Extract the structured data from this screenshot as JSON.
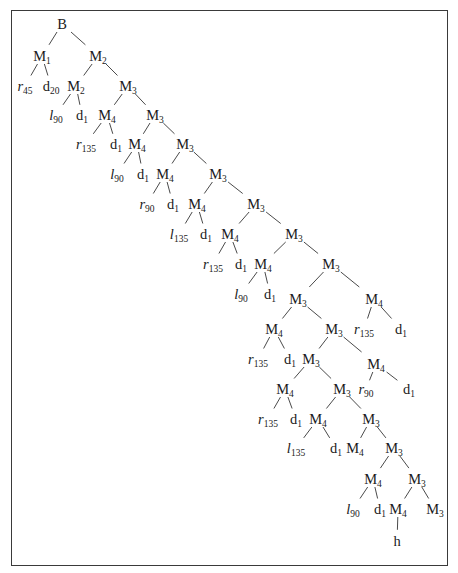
{
  "diagram": {
    "type": "derivation-tree",
    "frame": {
      "stroke": "#3a3a3a"
    },
    "colors": {
      "text": "#1a1a1a",
      "edge": "#4a4a4a",
      "background": "#ffffff"
    },
    "nodes": [
      {
        "id": "n0",
        "base": "B",
        "sub": "",
        "italic": false,
        "x": 62,
        "y": 28
      },
      {
        "id": "n1",
        "base": "M",
        "sub": "1",
        "italic": false,
        "x": 42,
        "y": 60
      },
      {
        "id": "n2",
        "base": "M",
        "sub": "2",
        "italic": false,
        "x": 98,
        "y": 60
      },
      {
        "id": "n3",
        "base": "r",
        "sub": "45",
        "italic": true,
        "x": 25,
        "y": 90
      },
      {
        "id": "n4",
        "base": "d",
        "sub": "20",
        "italic": false,
        "x": 51,
        "y": 90
      },
      {
        "id": "n5",
        "base": "M",
        "sub": "2",
        "italic": false,
        "x": 76,
        "y": 90
      },
      {
        "id": "n6",
        "base": "M",
        "sub": "3",
        "italic": false,
        "x": 128,
        "y": 90
      },
      {
        "id": "n7",
        "base": "l",
        "sub": "90",
        "italic": true,
        "x": 56,
        "y": 119
      },
      {
        "id": "n8",
        "base": "d",
        "sub": "1",
        "italic": false,
        "x": 82,
        "y": 119
      },
      {
        "id": "n9",
        "base": "M",
        "sub": "4",
        "italic": false,
        "x": 107,
        "y": 119
      },
      {
        "id": "n10",
        "base": "M",
        "sub": "3",
        "italic": false,
        "x": 155,
        "y": 119
      },
      {
        "id": "n11",
        "base": "r",
        "sub": "135",
        "italic": true,
        "x": 86,
        "y": 148
      },
      {
        "id": "n12",
        "base": "d",
        "sub": "1",
        "italic": false,
        "x": 116,
        "y": 148
      },
      {
        "id": "n13",
        "base": "M",
        "sub": "4",
        "italic": false,
        "x": 137,
        "y": 148
      },
      {
        "id": "n14",
        "base": "M",
        "sub": "3",
        "italic": false,
        "x": 185,
        "y": 148
      },
      {
        "id": "n15",
        "base": "l",
        "sub": "90",
        "italic": true,
        "x": 117,
        "y": 178
      },
      {
        "id": "n16",
        "base": "d",
        "sub": "1",
        "italic": false,
        "x": 143,
        "y": 178
      },
      {
        "id": "n17",
        "base": "M",
        "sub": "4",
        "italic": false,
        "x": 165,
        "y": 178
      },
      {
        "id": "n18",
        "base": "M",
        "sub": "3",
        "italic": false,
        "x": 218,
        "y": 178
      },
      {
        "id": "n19",
        "base": "r",
        "sub": "90",
        "italic": true,
        "x": 147,
        "y": 208
      },
      {
        "id": "n20",
        "base": "d",
        "sub": "1",
        "italic": false,
        "x": 173,
        "y": 208
      },
      {
        "id": "n21",
        "base": "M",
        "sub": "4",
        "italic": false,
        "x": 197,
        "y": 208
      },
      {
        "id": "n22",
        "base": "M",
        "sub": "3",
        "italic": false,
        "x": 256,
        "y": 208
      },
      {
        "id": "n23",
        "base": "l",
        "sub": "135",
        "italic": true,
        "x": 179,
        "y": 238
      },
      {
        "id": "n24",
        "base": "d",
        "sub": "1",
        "italic": false,
        "x": 206,
        "y": 238
      },
      {
        "id": "n25",
        "base": "M",
        "sub": "4",
        "italic": false,
        "x": 230,
        "y": 238
      },
      {
        "id": "n26",
        "base": "M",
        "sub": "3",
        "italic": false,
        "x": 294,
        "y": 238
      },
      {
        "id": "n27",
        "base": "r",
        "sub": "135",
        "italic": true,
        "x": 213,
        "y": 268
      },
      {
        "id": "n28",
        "base": "d",
        "sub": "1",
        "italic": false,
        "x": 241,
        "y": 268
      },
      {
        "id": "n29",
        "base": "M",
        "sub": "4",
        "italic": false,
        "x": 263,
        "y": 268
      },
      {
        "id": "n30",
        "base": "M",
        "sub": "3",
        "italic": false,
        "x": 331,
        "y": 268
      },
      {
        "id": "n31",
        "base": "l",
        "sub": "90",
        "italic": true,
        "x": 241,
        "y": 298
      },
      {
        "id": "n32",
        "base": "d",
        "sub": "1",
        "italic": false,
        "x": 270,
        "y": 298
      },
      {
        "id": "n33",
        "base": "M",
        "sub": "3",
        "italic": false,
        "x": 298,
        "y": 303
      },
      {
        "id": "n34",
        "base": "M",
        "sub": "4",
        "italic": false,
        "x": 374,
        "y": 303
      },
      {
        "id": "n35",
        "base": "M",
        "sub": "4",
        "italic": false,
        "x": 274,
        "y": 333
      },
      {
        "id": "n36",
        "base": "M",
        "sub": "3",
        "italic": false,
        "x": 334,
        "y": 333
      },
      {
        "id": "n37",
        "base": "r",
        "sub": "135",
        "italic": true,
        "x": 364,
        "y": 333
      },
      {
        "id": "n38",
        "base": "d",
        "sub": "1",
        "italic": false,
        "x": 401,
        "y": 333
      },
      {
        "id": "n39",
        "base": "r",
        "sub": "135",
        "italic": true,
        "x": 258,
        "y": 363
      },
      {
        "id": "n40",
        "base": "d",
        "sub": "1",
        "italic": false,
        "x": 290,
        "y": 363
      },
      {
        "id": "n41",
        "base": "M",
        "sub": "3",
        "italic": false,
        "x": 311,
        "y": 363
      },
      {
        "id": "n42",
        "base": "M",
        "sub": "4",
        "italic": false,
        "x": 376,
        "y": 368
      },
      {
        "id": "n43",
        "base": "M",
        "sub": "4",
        "italic": false,
        "x": 285,
        "y": 393
      },
      {
        "id": "n44",
        "base": "M",
        "sub": "3",
        "italic": false,
        "x": 342,
        "y": 393
      },
      {
        "id": "n45",
        "base": "r",
        "sub": "90",
        "italic": true,
        "x": 366,
        "y": 393
      },
      {
        "id": "n46",
        "base": "d",
        "sub": "1",
        "italic": false,
        "x": 409,
        "y": 393
      },
      {
        "id": "n47",
        "base": "r",
        "sub": "135",
        "italic": true,
        "x": 268,
        "y": 423
      },
      {
        "id": "n48",
        "base": "d",
        "sub": "1",
        "italic": false,
        "x": 296,
        "y": 423
      },
      {
        "id": "n49",
        "base": "M",
        "sub": "4",
        "italic": false,
        "x": 318,
        "y": 423
      },
      {
        "id": "n50",
        "base": "M",
        "sub": "3",
        "italic": false,
        "x": 371,
        "y": 423
      },
      {
        "id": "n51",
        "base": "l",
        "sub": "135",
        "italic": true,
        "x": 296,
        "y": 452
      },
      {
        "id": "n52",
        "base": "d",
        "sub": "1",
        "italic": false,
        "x": 336,
        "y": 452
      },
      {
        "id": "n53",
        "base": "M",
        "sub": "4",
        "italic": false,
        "x": 355,
        "y": 452
      },
      {
        "id": "n54",
        "base": "M",
        "sub": "3",
        "italic": false,
        "x": 394,
        "y": 452
      },
      {
        "id": "n55",
        "base": "M",
        "sub": "4",
        "italic": false,
        "x": 373,
        "y": 483
      },
      {
        "id": "n56",
        "base": "M",
        "sub": "3",
        "italic": false,
        "x": 417,
        "y": 483
      },
      {
        "id": "n57",
        "base": "l",
        "sub": "90",
        "italic": true,
        "x": 353,
        "y": 513
      },
      {
        "id": "n58",
        "base": "d",
        "sub": "1",
        "italic": false,
        "x": 380,
        "y": 513
      },
      {
        "id": "n59",
        "base": "M",
        "sub": "4",
        "italic": false,
        "x": 398,
        "y": 513
      },
      {
        "id": "n60",
        "base": "M",
        "sub": "3",
        "italic": false,
        "x": 435,
        "y": 513
      },
      {
        "id": "n61",
        "base": "h",
        "sub": "",
        "italic": false,
        "x": 397,
        "y": 545
      }
    ],
    "edges": [
      [
        "n0",
        "n1"
      ],
      [
        "n0",
        "n2"
      ],
      [
        "n1",
        "n3"
      ],
      [
        "n1",
        "n4"
      ],
      [
        "n2",
        "n5"
      ],
      [
        "n2",
        "n6"
      ],
      [
        "n5",
        "n7"
      ],
      [
        "n5",
        "n8"
      ],
      [
        "n6",
        "n9"
      ],
      [
        "n6",
        "n10"
      ],
      [
        "n9",
        "n11"
      ],
      [
        "n9",
        "n12"
      ],
      [
        "n10",
        "n13"
      ],
      [
        "n10",
        "n14"
      ],
      [
        "n13",
        "n15"
      ],
      [
        "n13",
        "n16"
      ],
      [
        "n14",
        "n17"
      ],
      [
        "n14",
        "n18"
      ],
      [
        "n17",
        "n19"
      ],
      [
        "n17",
        "n20"
      ],
      [
        "n18",
        "n21"
      ],
      [
        "n18",
        "n22"
      ],
      [
        "n21",
        "n23"
      ],
      [
        "n21",
        "n24"
      ],
      [
        "n22",
        "n25"
      ],
      [
        "n22",
        "n26"
      ],
      [
        "n25",
        "n27"
      ],
      [
        "n25",
        "n28"
      ],
      [
        "n26",
        "n29"
      ],
      [
        "n26",
        "n30"
      ],
      [
        "n29",
        "n31"
      ],
      [
        "n29",
        "n32"
      ],
      [
        "n30",
        "n33"
      ],
      [
        "n30",
        "n34"
      ],
      [
        "n34",
        "n37"
      ],
      [
        "n34",
        "n38"
      ],
      [
        "n33",
        "n35"
      ],
      [
        "n33",
        "n36"
      ],
      [
        "n35",
        "n39"
      ],
      [
        "n35",
        "n40"
      ],
      [
        "n36",
        "n41"
      ],
      [
        "n36",
        "n42"
      ],
      [
        "n42",
        "n45"
      ],
      [
        "n42",
        "n46"
      ],
      [
        "n41",
        "n43"
      ],
      [
        "n41",
        "n44"
      ],
      [
        "n43",
        "n47"
      ],
      [
        "n43",
        "n48"
      ],
      [
        "n44",
        "n49"
      ],
      [
        "n44",
        "n50"
      ],
      [
        "n49",
        "n51"
      ],
      [
        "n49",
        "n52"
      ],
      [
        "n50",
        "n53"
      ],
      [
        "n50",
        "n54"
      ],
      [
        "n54",
        "n55"
      ],
      [
        "n54",
        "n56"
      ],
      [
        "n55",
        "n57"
      ],
      [
        "n55",
        "n58"
      ],
      [
        "n56",
        "n59"
      ],
      [
        "n56",
        "n60"
      ],
      [
        "n59",
        "n61"
      ]
    ]
  }
}
